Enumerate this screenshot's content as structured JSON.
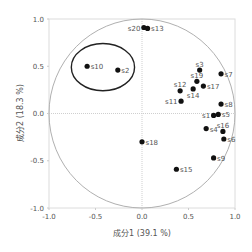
{
  "chart_data": {
    "type": "scatter",
    "title": "",
    "xlabel": "成分1 (39.1 %)",
    "ylabel": "成分2 (18.3 %)",
    "xlim": [
      -1.0,
      1.0
    ],
    "ylim": [
      -1.0,
      1.0
    ],
    "xticks": [
      "-1.0",
      "-0.5",
      "0.0",
      "0.5",
      "1.0"
    ],
    "yticks": [
      "1.0",
      "0.5",
      "0.0",
      "-0.5",
      "-1.0"
    ],
    "grid": false,
    "reference_lines": {
      "x0": true,
      "y0": true,
      "style": "dotted"
    },
    "unit_circle": true,
    "highlight_ellipse": {
      "cx": -0.42,
      "cy": 0.49,
      "rx": 0.34,
      "ry": 0.25,
      "encloses": [
        "s10",
        "s2"
      ]
    },
    "points": [
      {
        "label": "s20",
        "x": 0.02,
        "y": 0.91,
        "label_side": "left"
      },
      {
        "label": "s13",
        "x": 0.06,
        "y": 0.9,
        "label_side": "right"
      },
      {
        "label": "s10",
        "x": -0.59,
        "y": 0.5,
        "label_side": "right"
      },
      {
        "label": "s2",
        "x": -0.26,
        "y": 0.46,
        "label_side": "right"
      },
      {
        "label": "s3",
        "x": 0.62,
        "y": 0.46,
        "label_side": "above"
      },
      {
        "label": "s7",
        "x": 0.85,
        "y": 0.42,
        "label_side": "right"
      },
      {
        "label": "s19",
        "x": 0.59,
        "y": 0.34,
        "label_side": "above"
      },
      {
        "label": "s17",
        "x": 0.66,
        "y": 0.29,
        "label_side": "right"
      },
      {
        "label": "s12",
        "x": 0.41,
        "y": 0.24,
        "label_side": "above"
      },
      {
        "label": "s14",
        "x": 0.55,
        "y": 0.26,
        "label_side": "below"
      },
      {
        "label": "s11",
        "x": 0.42,
        "y": 0.13,
        "label_side": "left"
      },
      {
        "label": "s8",
        "x": 0.85,
        "y": 0.1,
        "label_side": "right"
      },
      {
        "label": "s1",
        "x": 0.77,
        "y": -0.02,
        "label_side": "left"
      },
      {
        "label": "s5",
        "x": 0.82,
        "y": -0.01,
        "label_side": "right"
      },
      {
        "label": "s4",
        "x": 0.69,
        "y": -0.16,
        "label_side": "right"
      },
      {
        "label": "s16",
        "x": 0.87,
        "y": -0.19,
        "label_side": "above"
      },
      {
        "label": "s6",
        "x": 0.88,
        "y": -0.27,
        "label_side": "right"
      },
      {
        "label": "s18",
        "x": 0.0,
        "y": -0.3,
        "label_side": "right"
      },
      {
        "label": "s9",
        "x": 0.77,
        "y": -0.47,
        "label_side": "right"
      },
      {
        "label": "s15",
        "x": 0.37,
        "y": -0.59,
        "label_side": "right"
      }
    ],
    "colors": {
      "points": "#111111",
      "ellipse": "#222222",
      "circle": "#b0b0b0",
      "frame": "#d8d8d8",
      "text": "#555555"
    }
  }
}
